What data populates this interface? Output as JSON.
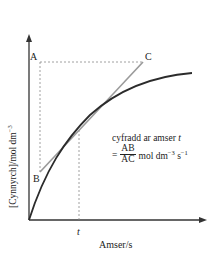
{
  "diagram": {
    "y_axis_label_main": "[Cynnyrch]/mol dm",
    "y_axis_label_exp": "−3",
    "x_axis_label": "Amser/s",
    "t_tick_label": "t",
    "points": {
      "A": "A",
      "B": "B",
      "C": "C"
    },
    "formula": {
      "line1_text": "cyfradd ar amser ",
      "line1_var": "t",
      "equals": "=",
      "numerator": "AB",
      "denominator": "AC",
      "units_main": "mol dm",
      "units_exp1": "−3",
      "units_s": " s",
      "units_exp2": "−1"
    },
    "colors": {
      "axis": "#333333",
      "curve": "#2b2b2b",
      "tangent": "#9a9a9a",
      "dashed": "#888888"
    }
  }
}
